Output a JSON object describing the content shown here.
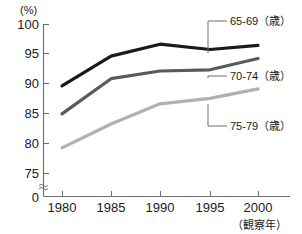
{
  "chart_data": {
    "type": "line",
    "title": "",
    "xlabel": "（観察年）",
    "ylabel": "(%)",
    "x": [
      1980,
      1985,
      1990,
      1995,
      2000
    ],
    "xtick_labels": [
      "1980",
      "1985",
      "1990",
      "1995",
      "2000"
    ],
    "ytick_labels": [
      "100",
      "95",
      "90",
      "85",
      "80",
      "75",
      "0"
    ],
    "ytick_values": [
      100,
      95,
      90,
      85,
      80,
      75,
      0
    ],
    "ylim": [
      75,
      100
    ],
    "axis_break": true,
    "axis_break_symbol": "≈",
    "grid": false,
    "legend_position": "right-inline-leader",
    "series": [
      {
        "name": "65-69（歳）",
        "color": "#1a1a1a",
        "values": [
          89.7,
          94.7,
          96.7,
          95.8,
          96.5
        ]
      },
      {
        "name": "70-74（歳）",
        "color": "#5a5a5a",
        "values": [
          85.0,
          90.9,
          92.2,
          92.4,
          94.3
        ]
      },
      {
        "name": "75-79（歳）",
        "color": "#b0b0b0",
        "values": [
          79.3,
          83.3,
          86.7,
          87.6,
          89.2
        ]
      }
    ],
    "annotations": [
      {
        "label": "65-69（歳）",
        "target_x": 1995,
        "series_index": 0
      },
      {
        "label": "70-74（歳）",
        "target_x": 1995,
        "series_index": 1
      },
      {
        "label": "75-79（歳）",
        "target_x": 1995,
        "series_index": 2
      }
    ]
  },
  "axes": {
    "y_unit": "(%)",
    "x_caption": "（観察年）"
  }
}
